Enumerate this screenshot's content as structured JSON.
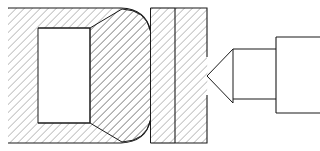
{
  "drawing": {
    "title": "Machining cross-section: workpiece and cutting tool",
    "type": "engineering-cross-section",
    "canvas": {
      "width": 320,
      "height": 151,
      "background": "#ffffff"
    },
    "style": {
      "line_color": "#1a1a1a",
      "hatch_color": "#595959",
      "hatch_angle_deg": 45,
      "hatch_spacing_px": 4,
      "hatch_stroke_width": 0.7,
      "outline_stroke_width": 1.0,
      "cavity_fill": "#ffffff"
    },
    "parts": [
      {
        "id": "outer-body",
        "name": "outer-housing-body",
        "label": "Outer housing (sectioned)",
        "hatched": true,
        "bounds": {
          "x": 8,
          "y": 8,
          "width": 142,
          "height": 135
        },
        "notes": "C-shaped sectioned housing with rounded right-hand corners"
      },
      {
        "id": "inner-cavity",
        "name": "inner-cavity",
        "label": "Internal cavity (bore)",
        "hatched": false,
        "bounds": {
          "x": 38,
          "y": 28,
          "width": 52,
          "height": 95
        }
      },
      {
        "id": "tapered-wedge",
        "name": "tapered-wedge-insert",
        "label": "Tapered wedge insert (sectioned)",
        "hatched": true,
        "bounds": {
          "x": 90,
          "y": 8,
          "width": 85,
          "height": 135
        },
        "notes": "Taper narrows toward the left, concave flanks near the housing"
      },
      {
        "id": "backing-block",
        "name": "backing-block",
        "label": "Backing block (sectioned)",
        "hatched": true,
        "bounds": {
          "x": 175,
          "y": 8,
          "width": 32,
          "height": 135
        },
        "notes": "Right edge carries a V-notch engaged by the tool tip"
      },
      {
        "id": "tool-tip",
        "name": "cutting-tool-tip",
        "label": "Cutting tool tip (V point)",
        "hatched": false,
        "apex": {
          "x": 207,
          "y": 76
        },
        "bounds": {
          "x": 207,
          "y": 49,
          "width": 26,
          "height": 54
        }
      },
      {
        "id": "tool-body",
        "name": "cutting-tool-body",
        "label": "Tool body",
        "hatched": false,
        "bounds": {
          "x": 233,
          "y": 49,
          "width": 43,
          "height": 50
        }
      },
      {
        "id": "tool-shank",
        "name": "cutting-tool-shank",
        "label": "Tool shank",
        "hatched": false,
        "bounds": {
          "x": 276,
          "y": 37,
          "width": 44,
          "height": 76
        },
        "notes": "Extends past the right edge of the frame"
      }
    ],
    "geometry": {
      "outer_body_path": "M 8 8 L 121 8 Q 145 9 150 30 L 150 121 Q 145 142 121 143 L 8 143",
      "inner_cavity_path": "M 38 28 L 90 28 L 90 123 L 38 123 Z",
      "wedge_path": "M 90 28 L 121 9 Q 145 10 150 30 L 150 121 Q 145 141 121 142 L 90 123 Z",
      "wedge_right_path": "M 150 8 L 175 8 L 175 143 L 150 143 Z",
      "backing_block_path": "M 175 8 L 207 8 L 207 57 L 207 76 L 207 95 L 207 143 L 175 143 Z",
      "v_notch_path": "M 207 76 L 233 49 L 233 103 Z",
      "tool_body_path": "M 233 49 L 276 49 L 276 99 L 233 99 Z",
      "tool_shank_path": "M 276 37 L 320 37 M 276 37 L 276 113 M 276 113 L 320 113",
      "cavity_left_edge_x": 38,
      "cavity_right_edge_x": 90,
      "wedge_seam_x": 150,
      "block_seam_x": 175,
      "block_right_x": 207,
      "tool_apex_y": 76
    }
  }
}
